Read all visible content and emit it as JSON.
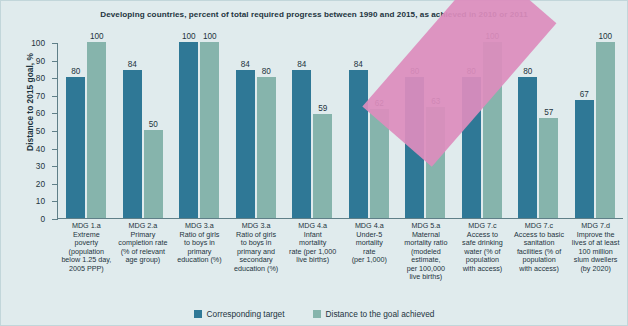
{
  "chart_data": {
    "type": "bar",
    "title": "Developing countries, percent of total required progress between 1990 and 2015, as achieved in 2010 or 2011",
    "xlabel": "",
    "ylabel": "Distance to 2015 goal, %",
    "ylim": [
      0,
      100
    ],
    "yticks": [
      0,
      10,
      20,
      30,
      40,
      50,
      60,
      70,
      80,
      90,
      100
    ],
    "grid": false,
    "legend_position": "bottom",
    "categories": [
      "MDG 1.a Extreme poverty (population below 1.25 day, 2005 PPP)",
      "MDG 2.a Primary completion rate (% of relevant age group)",
      "MDG 3.a Ratio of girls to boys in primary education (%)",
      "MDG 3.a Ratio of girls to boys in primary and secondary education (%)",
      "MDG 4.a Infant mortality rate (per 1,000 live births)",
      "MDG 4.a Under-5 mortality rate (per 1,000)",
      "MDG 5.a Maternal mortality ratio (modeled estimate, per 100,000 live births)",
      "MDG 7.c Access to safe drinking water (% of population with access)",
      "MDG 7.c Access to basic sanitation facilities (% of population with access)",
      "MDG 7.d Improve the lives of at least 100 million slum dwellers (by 2020)"
    ],
    "category_lines": [
      [
        "MDG 1.a",
        "Extreme",
        "poverty",
        "(population",
        "below 1.25 day,",
        "2005 PPP)"
      ],
      [
        "MDG 2.a",
        "Primary",
        "completion rate",
        "(% of relevant",
        "age group)"
      ],
      [
        "MDG 3.a",
        "Ratio of girls",
        "to boys in",
        "primary",
        "education (%)"
      ],
      [
        "MDG 3.a",
        "Ratio of girls",
        "to boys in",
        "primary and",
        "secondary",
        "education (%)"
      ],
      [
        "MDG 4.a",
        "Infant",
        "mortality",
        "rate (per 1,000",
        "live births)"
      ],
      [
        "MDG 4.a",
        "Under-5",
        "mortality",
        "rate",
        "(per 1,000)"
      ],
      [
        "MDG 5.a",
        "Maternal",
        "mortality ratio",
        "(modeled",
        "estimate,",
        "per 100,000",
        "live births)"
      ],
      [
        "MDG 7.c",
        "Access to",
        "safe drinking",
        "water (% of",
        "population",
        "with access)"
      ],
      [
        "MDG 7.c",
        "Access to basic",
        "sanitation",
        "facilities (% of",
        "population",
        "with access)"
      ],
      [
        "MDG 7.d",
        "Improve the",
        "lives of at least",
        "100 million",
        "slum dwellers",
        "(by 2020)"
      ]
    ],
    "series": [
      {
        "name": "Corresponding target",
        "color": "#2f7896",
        "values": [
          80,
          84,
          100,
          84,
          84,
          84,
          80,
          80,
          80,
          67
        ]
      },
      {
        "name": "Distance to the goal achieved",
        "color": "#86b4ac",
        "values": [
          100,
          50,
          100,
          80,
          59,
          62,
          63,
          100,
          57,
          100
        ]
      }
    ]
  },
  "colors": {
    "background": "#e0ebed",
    "target": "#2f7896",
    "achieved": "#86b4ac",
    "axis": "#5f7f88",
    "overlay_band": "#dd8dbd",
    "text": "#1d3440"
  }
}
